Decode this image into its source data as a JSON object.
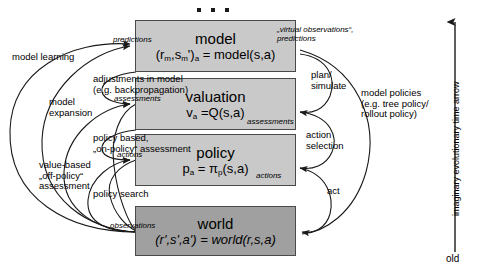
{
  "diagram": {
    "top_ellipsis": "...",
    "boxes": [
      {
        "name": "model",
        "title": "model",
        "formula_main": "(r",
        "formula_full": "(rm,sm')a = model(s,a)",
        "style": "light"
      },
      {
        "name": "valuation",
        "title": "valuation",
        "formula_full": "va =Q(s,a)",
        "style": "light"
      },
      {
        "name": "policy",
        "title": "policy",
        "formula_full": "pa = πp(s,a)",
        "style": "light"
      },
      {
        "name": "world",
        "title": "world",
        "formula_full": "(r',s',a') = world(r,s,a)",
        "style": "dark"
      }
    ],
    "left_labels": [
      {
        "name": "model-learning",
        "text": "model learning"
      },
      {
        "name": "model-expansion",
        "text": "model\nexpansion"
      },
      {
        "name": "value-based",
        "text": "value-based\n„off-policy“\nassessment"
      },
      {
        "name": "adjustments",
        "text": "adjustments in model\n(e.g. backpropagation)"
      },
      {
        "name": "policy-based",
        "text": "policy based,\n„on-policy“ assessment"
      },
      {
        "name": "policy-search",
        "text": "policy search"
      }
    ],
    "left_italic_labels": [
      {
        "name": "predictions",
        "text": "predictions"
      },
      {
        "name": "assessments",
        "text": "assessments"
      },
      {
        "name": "actions",
        "text": "actions"
      },
      {
        "name": "observations",
        "text": "observations"
      }
    ],
    "right_italic_labels": [
      {
        "name": "virtual-observations",
        "text": "„virtual observations“,\npredictions"
      },
      {
        "name": "assessments-right",
        "text": "assessments"
      },
      {
        "name": "actions-right",
        "text": "actions"
      }
    ],
    "right_labels": [
      {
        "name": "plan-simulate",
        "text": "plan/\nsimulate"
      },
      {
        "name": "action-selection",
        "text": "action\nselection"
      },
      {
        "name": "act",
        "text": "act"
      },
      {
        "name": "model-policies",
        "text": "model policies\n(e.g. tree policy/\nrollout policy)"
      }
    ],
    "time_arrow": {
      "label": "imaginary evolutionary time arrow",
      "bottom_label": "old"
    },
    "colors": {
      "box_light": "#c9c9c9",
      "box_dark": "#a0a0a0",
      "stroke": "#1a1a1a",
      "background": "#ffffff"
    }
  }
}
